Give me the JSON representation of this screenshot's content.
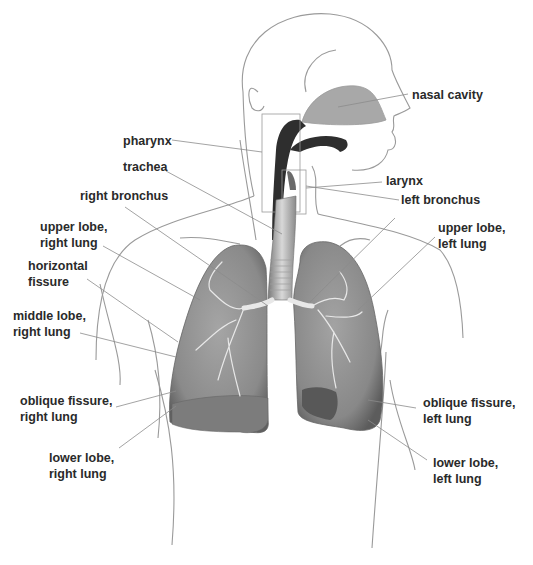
{
  "diagram": {
    "colors": {
      "outline": "#9a9a9a",
      "leader_line": "#8c8c8c",
      "lung_fill": "#8e8e8e",
      "lung_dark": "#5e5e5e",
      "airway_dark": "#2e2e2e",
      "nasal_fill": "#a8a8a8",
      "label_text": "#2a2a2a"
    },
    "labels": [
      {
        "id": "nasal-cavity",
        "text": "nasal cavity",
        "x": 412,
        "y": 87
      },
      {
        "id": "pharynx",
        "text": "pharynx",
        "x": 123,
        "y": 134
      },
      {
        "id": "trachea",
        "text": "trachea",
        "x": 123,
        "y": 159
      },
      {
        "id": "larynx",
        "text": "larynx",
        "x": 386,
        "y": 174
      },
      {
        "id": "right-bronchus",
        "text": "right bronchus",
        "x": 80,
        "y": 188
      },
      {
        "id": "left-bronchus",
        "text": "left bronchus",
        "x": 401,
        "y": 193
      },
      {
        "id": "upper-lobe-right-lung",
        "text": "upper lobe,\nright lung",
        "x": 40,
        "y": 220
      },
      {
        "id": "upper-lobe-left-lung",
        "text": "upper lobe,\nleft lung",
        "x": 438,
        "y": 220
      },
      {
        "id": "horizontal-fissure",
        "text": "horizontal\nfissure",
        "x": 28,
        "y": 258
      },
      {
        "id": "middle-lobe-right-lung",
        "text": "middle lobe,\nright lung",
        "x": 13,
        "y": 308
      },
      {
        "id": "oblique-fissure-right-lung",
        "text": "oblique fissure,\nright lung",
        "x": 20,
        "y": 393
      },
      {
        "id": "oblique-fissure-left-lung",
        "text": "oblique fissure,\nleft lung",
        "x": 423,
        "y": 395
      },
      {
        "id": "lower-lobe-right-lung",
        "text": "lower lobe,\nright lung",
        "x": 49,
        "y": 450
      },
      {
        "id": "lower-lobe-left-lung",
        "text": "lower lobe,\nleft lung",
        "x": 433,
        "y": 455
      }
    ]
  }
}
